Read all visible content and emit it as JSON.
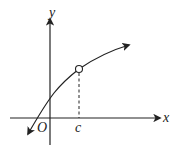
{
  "diagram": {
    "type": "function-graph",
    "labels": {
      "x_axis": "x",
      "y_axis": "y",
      "origin": "O",
      "point_c": "c"
    },
    "colors": {
      "stroke": "#222222",
      "background": "#ffffff",
      "hole_fill": "#ffffff"
    },
    "elements": {
      "x_axis": {
        "from": [
          10,
          118
        ],
        "to": [
          160,
          118
        ],
        "arrow": "right"
      },
      "y_axis": {
        "from": [
          50,
          145
        ],
        "to": [
          50,
          18
        ],
        "arrow": "up"
      },
      "curve": {
        "start": [
          27,
          136
        ],
        "through": [
          [
            50,
            97
          ],
          [
            79,
            69
          ]
        ],
        "end": [
          130,
          45
        ],
        "arrows": "both ends"
      },
      "open_circle": {
        "center": [
          79,
          69
        ],
        "radius": 3.5
      },
      "dashed_line": {
        "from": [
          79,
          72
        ],
        "to": [
          79,
          118
        ]
      }
    }
  }
}
